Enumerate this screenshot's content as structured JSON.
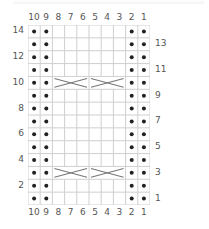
{
  "chart": {
    "columns": 10,
    "rows": 14,
    "column_labels_top": [
      "10",
      "9",
      "8",
      "7",
      "6",
      "5",
      "4",
      "3",
      "2",
      "1"
    ],
    "column_labels_bottom": [
      "10",
      "9",
      "8",
      "7",
      "6",
      "5",
      "4",
      "3",
      "2",
      "1"
    ],
    "row_labels_left": [
      "14",
      "12",
      "10",
      "8",
      "6",
      "4",
      "2"
    ],
    "row_labels_right": [
      "13",
      "11",
      "9",
      "7",
      "5",
      "3",
      "1"
    ],
    "purl_columns": [
      10,
      9,
      2,
      1
    ],
    "cable_rows": [
      10,
      3
    ],
    "cables": [
      {
        "row": 10,
        "from_col": 8,
        "to_col": 6,
        "symbol": "cable-cross"
      },
      {
        "row": 10,
        "from_col": 5,
        "to_col": 3,
        "symbol": "cable-cross"
      },
      {
        "row": 3,
        "from_col": 8,
        "to_col": 6,
        "symbol": "cable-cross"
      },
      {
        "row": 3,
        "from_col": 5,
        "to_col": 3,
        "symbol": "cable-cross"
      }
    ],
    "colors": {
      "grid_line": "#cfcfcf",
      "dot": "#222222",
      "cable_line": "#777777",
      "label": "#555555"
    }
  }
}
